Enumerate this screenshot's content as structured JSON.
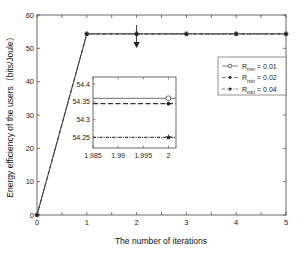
{
  "chart_data": {
    "type": "line",
    "title": "",
    "xlabel": "The number of iterations",
    "ylabel": "Energy efficiency of the users（bits/Joule）",
    "xlim": [
      0,
      5
    ],
    "ylim": [
      0,
      60
    ],
    "xticks": [
      "0",
      "1",
      "2",
      "3",
      "4",
      "5"
    ],
    "yticks": [
      "0",
      "10",
      "20",
      "30",
      "40",
      "50",
      "60"
    ],
    "grid": false,
    "legend_position": "upper right (inside)",
    "x": [
      0,
      1,
      2,
      3,
      4,
      5
    ],
    "series": [
      {
        "name": "R_min = 0.01",
        "marker": "circle",
        "linestyle": "solid",
        "values": [
          0,
          54.36,
          54.36,
          54.36,
          54.36,
          54.36
        ]
      },
      {
        "name": "R_min = 0.02",
        "marker": "dot",
        "linestyle": "dashed",
        "values": [
          0,
          54.345,
          54.345,
          54.345,
          54.345,
          54.345
        ]
      },
      {
        "name": "R_min = 0.04",
        "marker": "star",
        "linestyle": "dash-dot",
        "values": [
          0,
          54.25,
          54.25,
          54.25,
          54.25,
          54.25
        ]
      }
    ],
    "inset": {
      "xlim": [
        1.985,
        2.0015
      ],
      "ylim": [
        54.22,
        54.42
      ],
      "xticks": [
        "1.985",
        "1.99",
        "1.995",
        "2"
      ],
      "yticks": [
        "54.25",
        "54.3",
        "54.35",
        "54.4"
      ],
      "values_at_x2": {
        "R_min = 0.01": 54.36,
        "R_min = 0.02": 54.345,
        "R_min = 0.04": 54.25
      }
    },
    "annotations": [
      "Downward arrow from curve at iteration 2 pointing to zoomed inset"
    ]
  },
  "legend": {
    "items": [
      {
        "prefix": "R",
        "sub": "min",
        "suffix": " = 0.01"
      },
      {
        "prefix": "R",
        "sub": "min",
        "suffix": " = 0.02"
      },
      {
        "prefix": "R",
        "sub": "min",
        "suffix": " = 0.04"
      }
    ]
  },
  "axes": {
    "xlabel": "The number of iterations",
    "ylabel": "Energy efficiency of the users（bits/Joule）"
  }
}
